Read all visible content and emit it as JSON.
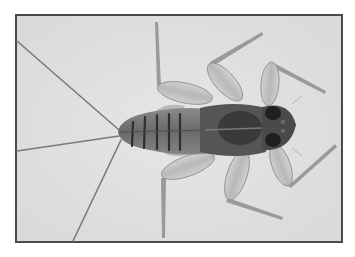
{
  "image": {
    "subject": "Mayfly nymph, dorsal view",
    "style": "grayscale photograph with dark frame border",
    "colors": {
      "page_background": "#ffffff",
      "photo_background": "#e2e2e2",
      "frame_border": "#4a4a4a",
      "body_dark": "#3c3c3c",
      "body_mid": "#6e6e6e",
      "leg_fill": "#c4c4c4",
      "leg_edge": "#8a8a8a",
      "cerci": "#7a7a7a"
    }
  }
}
